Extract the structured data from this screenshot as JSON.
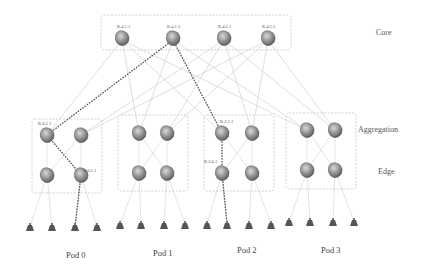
{
  "layers": {
    "core": "Core",
    "aggregation": "Aggregation",
    "edge": "Edge"
  },
  "pods": [
    {
      "label": "Pod 0"
    },
    {
      "label": "Pod 1"
    },
    {
      "label": "Pod 2"
    },
    {
      "label": "Pod 3"
    }
  ],
  "core_switches": [
    {
      "label": "R.4.1.1"
    },
    {
      "label": "R.4.1.2"
    },
    {
      "label": "R.4.2.1"
    },
    {
      "label": "R.4.2.2"
    }
  ],
  "switch_labels": {
    "pod0_agg": "R.0.2.1",
    "pod0_edge": "R.0.1.1",
    "pod2_agg": "R.2.2.1",
    "pod2_edge": "R.2.0.1"
  },
  "colors": {
    "router_fill": "#8a8a8a",
    "host_fill": "#5a5a5a",
    "link": "#c8c8c8",
    "highlight_path": "#555555",
    "box_border": "#bbbbbb"
  }
}
